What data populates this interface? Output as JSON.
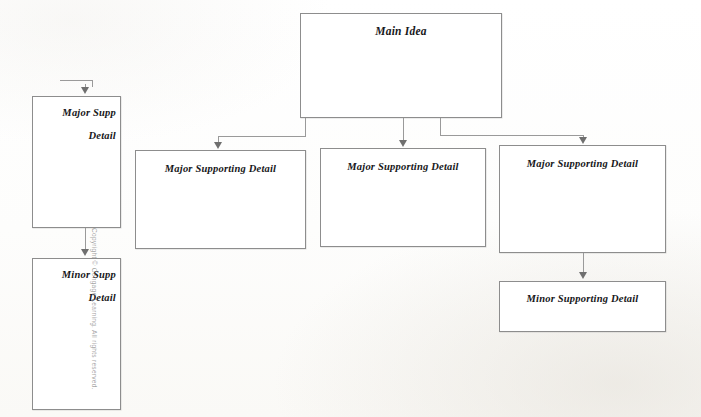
{
  "document": {
    "type": "graphic-organizer-diagram",
    "description": "Main Idea and Supporting Detail hierarchy chart"
  },
  "nodes": {
    "main_idea": {
      "label": "Main Idea"
    },
    "major_1": {
      "label": "Major Supporting Detail"
    },
    "major_2": {
      "label": "Major Supporting Detail"
    },
    "major_3": {
      "label": "Major Supporting Detail"
    },
    "minor_right": {
      "label": "Minor Supporting Detail"
    },
    "major_left_cut": {
      "line1": "Major Supp",
      "line2": "Detail"
    },
    "minor_left_cut": {
      "line1": "Minor Supp",
      "line2": "Detail"
    }
  },
  "attribution": {
    "copyright_vertical": "Copyright © Cengage Learning. All rights reserved."
  },
  "colors": {
    "box_border": "#8d8d8d",
    "connector": "#9a9a9a",
    "arrowhead": "#6f6f6f",
    "text": "#17171a",
    "page_background": "#ffffff"
  }
}
